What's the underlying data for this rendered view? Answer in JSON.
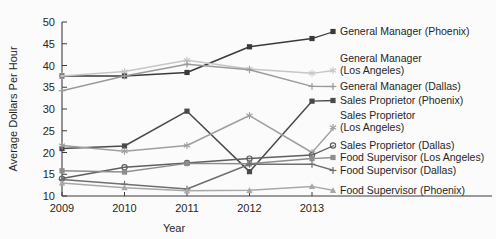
{
  "chart_data": {
    "type": "line",
    "title": "",
    "xlabel": "Year",
    "ylabel": "Average Dollars Per Hour",
    "x": [
      2009,
      2010,
      2011,
      2012,
      2013
    ],
    "xtick_labels": [
      "2009",
      "2010",
      "2011",
      "2012",
      "2013"
    ],
    "ytick_labels": [
      "10",
      "15",
      "20",
      "25",
      "30",
      "35",
      "40",
      "45",
      "50"
    ],
    "yticks": [
      10,
      15,
      20,
      25,
      30,
      35,
      40,
      45,
      50
    ],
    "ylim": [
      10,
      50
    ],
    "xlim": [
      2009,
      2013
    ],
    "grid": false,
    "legend_position": "right",
    "series": [
      {
        "name": "General Manager (Phoenix)",
        "values": [
          37.6,
          37.6,
          38.4,
          44.3,
          46.2
        ],
        "color": "#3a3a3a",
        "marker": "square"
      },
      {
        "name": "General Manager (Los Angeles)",
        "values": [
          37.6,
          38.6,
          41.2,
          39.2,
          38.2
        ],
        "color": "#c6c6c6",
        "marker": "asterisk"
      },
      {
        "name": "General Manager (Dallas)",
        "values": [
          34.2,
          37.6,
          40.3,
          39.0,
          35.2
        ],
        "color": "#9a9a9a",
        "marker": "plus"
      },
      {
        "name": "Sales Proprietor (Phoenix)",
        "values": [
          20.9,
          21.5,
          29.5,
          15.6,
          31.8
        ],
        "color": "#4a4a4a",
        "marker": "square"
      },
      {
        "name": "Sales Proprietor (Los Angeles)",
        "values": [
          21.6,
          20.3,
          21.6,
          28.5,
          20.0
        ],
        "color": "#9f9f9f",
        "marker": "asterisk"
      },
      {
        "name": "Sales Proprietor (Dallas)",
        "values": [
          14.0,
          16.6,
          17.6,
          18.6,
          19.4
        ],
        "color": "#5e5e5e",
        "marker": "circle"
      },
      {
        "name": "Food Supervisor (Los Angeles)",
        "values": [
          15.8,
          15.5,
          17.5,
          17.4,
          18.6
        ],
        "color": "#8d8d8d",
        "marker": "square"
      },
      {
        "name": "Food Supervisor (Dallas)",
        "values": [
          13.8,
          12.7,
          11.6,
          17.3,
          17.3
        ],
        "color": "#6f6f6f",
        "marker": "plus"
      },
      {
        "name": "Food Supervisor (Phoenix)",
        "values": [
          13.0,
          11.9,
          11.2,
          11.3,
          12.2
        ],
        "color": "#a8a8a8",
        "marker": "triangle"
      }
    ]
  },
  "legend": {
    "entries": [
      {
        "label": "General Manager (Phoenix)",
        "color": "#3a3a3a"
      },
      {
        "label": "General Manager",
        "color": "#c6c6c6"
      },
      {
        "label": "(Los Angeles)",
        "color": "#c6c6c6"
      },
      {
        "label": "General Manager (Dallas)",
        "color": "#9a9a9a"
      },
      {
        "label": "Sales Proprietor (Phoenix)",
        "color": "#4a4a4a"
      },
      {
        "label": "Sales Proprietor",
        "color": "#9f9f9f"
      },
      {
        "label": "(Los Angeles)",
        "color": "#9f9f9f"
      },
      {
        "label": "Sales Proprietor (Dallas)",
        "color": "#5e5e5e"
      },
      {
        "label": "Food Supervisor (Los Angeles)",
        "color": "#8d8d8d"
      },
      {
        "label": "Food Supervisor (Dallas)",
        "color": "#6f6f6f"
      },
      {
        "label": "Food Supervisor (Phoenix)",
        "color": "#a8a8a8"
      }
    ]
  }
}
